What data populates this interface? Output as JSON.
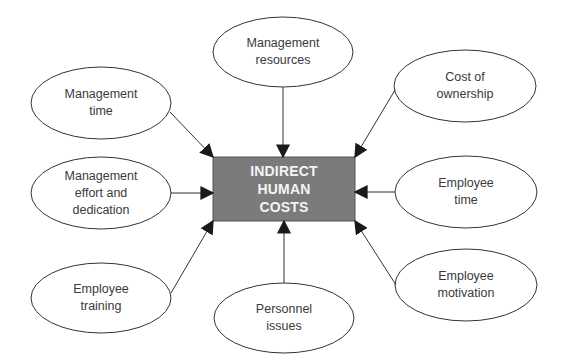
{
  "center": {
    "label": "INDIRECT\nHUMAN\nCOSTS",
    "fill": "#7b7b7b"
  },
  "nodes": [
    {
      "id": "management-time",
      "label": "Management\ntime"
    },
    {
      "id": "management-resources",
      "label": "Management\nresources"
    },
    {
      "id": "cost-of-ownership",
      "label": "Cost of\nownership"
    },
    {
      "id": "management-effort",
      "label": "Management\neffort and\ndedication"
    },
    {
      "id": "employee-time",
      "label": "Employee\ntime"
    },
    {
      "id": "employee-training",
      "label": "Employee\ntraining"
    },
    {
      "id": "personnel-issues",
      "label": "Personnel\nissues"
    },
    {
      "id": "employee-motivation",
      "label": "Employee\nmotivation"
    }
  ]
}
